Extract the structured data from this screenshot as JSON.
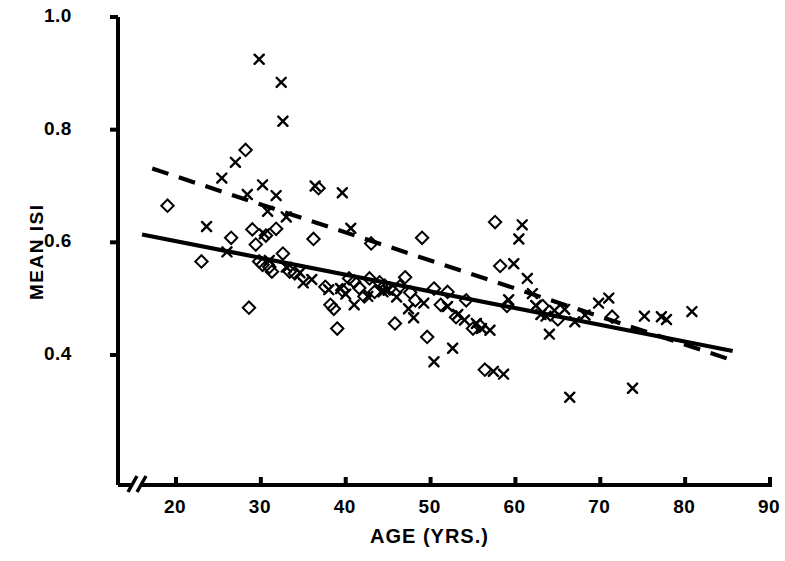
{
  "chart_data": {
    "type": "scatter",
    "title": "",
    "xlabel": "AGE  (YRS.)",
    "ylabel": "MEAN ISI",
    "xlim": [
      15,
      90
    ],
    "ylim": [
      0.29,
      1.0
    ],
    "grid": false,
    "legend_position": "none",
    "axis_break": {
      "axis": "x",
      "at": 16,
      "symbol": "//"
    },
    "xticks": [
      20,
      30,
      40,
      50,
      60,
      70,
      80,
      90
    ],
    "xtick_labels": [
      "20",
      "30",
      "40",
      "50",
      "60",
      "70",
      "80",
      "90"
    ],
    "yticks": [
      0.4,
      0.6,
      0.8,
      1.0
    ],
    "ytick_labels": [
      "0.4",
      "0.6",
      "0.8",
      "1.0"
    ],
    "series": [
      {
        "name": "diamond-group",
        "marker": "diamond",
        "color": "#000000",
        "points": [
          [
            19.0,
            0.665
          ],
          [
            23.0,
            0.566
          ],
          [
            26.5,
            0.608
          ],
          [
            28.2,
            0.764
          ],
          [
            29.0,
            0.623
          ],
          [
            29.4,
            0.596
          ],
          [
            29.8,
            0.566
          ],
          [
            30.2,
            0.56
          ],
          [
            30.6,
            0.612
          ],
          [
            31.0,
            0.556
          ],
          [
            31.3,
            0.548
          ],
          [
            31.8,
            0.624
          ],
          [
            28.6,
            0.484
          ],
          [
            32.6,
            0.58
          ],
          [
            33.4,
            0.548
          ],
          [
            34.0,
            0.545
          ],
          [
            36.2,
            0.606
          ],
          [
            37.6,
            0.521
          ],
          [
            38.2,
            0.489
          ],
          [
            38.6,
            0.482
          ],
          [
            39.0,
            0.447
          ],
          [
            39.6,
            0.515
          ],
          [
            40.4,
            0.536
          ],
          [
            41.0,
            0.53
          ],
          [
            41.6,
            0.519
          ],
          [
            42.2,
            0.504
          ],
          [
            42.8,
            0.536
          ],
          [
            43.4,
            0.512
          ],
          [
            44.0,
            0.529
          ],
          [
            44.6,
            0.523
          ],
          [
            45.2,
            0.518
          ],
          [
            45.8,
            0.456
          ],
          [
            46.4,
            0.522
          ],
          [
            47.0,
            0.538
          ],
          [
            47.6,
            0.511
          ],
          [
            48.2,
            0.497
          ],
          [
            49.0,
            0.608
          ],
          [
            49.6,
            0.432
          ],
          [
            50.4,
            0.518
          ],
          [
            51.2,
            0.489
          ],
          [
            52.0,
            0.512
          ],
          [
            53.0,
            0.467
          ],
          [
            54.2,
            0.497
          ],
          [
            55.0,
            0.447
          ],
          [
            55.8,
            0.452
          ],
          [
            56.4,
            0.374
          ],
          [
            57.6,
            0.636
          ],
          [
            58.2,
            0.558
          ],
          [
            59.0,
            0.487
          ],
          [
            63.2,
            0.487
          ],
          [
            65.0,
            0.463
          ],
          [
            71.4,
            0.468
          ],
          [
            36.8,
            0.696
          ],
          [
            43.0,
            0.598
          ]
        ]
      },
      {
        "name": "cross-group",
        "marker": "x",
        "color": "#000000",
        "points": [
          [
            29.8,
            0.925
          ],
          [
            32.4,
            0.884
          ],
          [
            32.6,
            0.815
          ],
          [
            27.0,
            0.742
          ],
          [
            30.2,
            0.702
          ],
          [
            25.4,
            0.714
          ],
          [
            28.4,
            0.685
          ],
          [
            31.8,
            0.683
          ],
          [
            30.8,
            0.655
          ],
          [
            33.0,
            0.645
          ],
          [
            23.6,
            0.628
          ],
          [
            30.4,
            0.615
          ],
          [
            36.4,
            0.7
          ],
          [
            39.6,
            0.688
          ],
          [
            40.6,
            0.625
          ],
          [
            26.0,
            0.583
          ],
          [
            31.0,
            0.568
          ],
          [
            34.6,
            0.546
          ],
          [
            33.0,
            0.556
          ],
          [
            35.0,
            0.528
          ],
          [
            36.0,
            0.534
          ],
          [
            38.0,
            0.516
          ],
          [
            39.4,
            0.518
          ],
          [
            40.0,
            0.508
          ],
          [
            41.0,
            0.489
          ],
          [
            42.6,
            0.504
          ],
          [
            44.4,
            0.512
          ],
          [
            46.0,
            0.503
          ],
          [
            47.4,
            0.482
          ],
          [
            48.0,
            0.466
          ],
          [
            49.2,
            0.492
          ],
          [
            50.4,
            0.388
          ],
          [
            52.0,
            0.486
          ],
          [
            53.2,
            0.472
          ],
          [
            54.0,
            0.462
          ],
          [
            55.4,
            0.456
          ],
          [
            56.0,
            0.447
          ],
          [
            57.0,
            0.444
          ],
          [
            57.4,
            0.371
          ],
          [
            58.6,
            0.366
          ],
          [
            59.2,
            0.498
          ],
          [
            59.8,
            0.562
          ],
          [
            60.4,
            0.606
          ],
          [
            60.8,
            0.631
          ],
          [
            61.4,
            0.536
          ],
          [
            62.0,
            0.509
          ],
          [
            62.4,
            0.488
          ],
          [
            63.0,
            0.472
          ],
          [
            63.6,
            0.469
          ],
          [
            64.0,
            0.437
          ],
          [
            64.6,
            0.479
          ],
          [
            65.8,
            0.481
          ],
          [
            66.4,
            0.325
          ],
          [
            67.0,
            0.459
          ],
          [
            68.2,
            0.471
          ],
          [
            69.8,
            0.492
          ],
          [
            71.0,
            0.501
          ],
          [
            73.8,
            0.341
          ],
          [
            75.2,
            0.469
          ],
          [
            77.2,
            0.468
          ],
          [
            77.8,
            0.463
          ],
          [
            80.8,
            0.477
          ],
          [
            52.6,
            0.412
          ],
          [
            45.0,
            0.515
          ]
        ]
      }
    ],
    "fit_lines": [
      {
        "name": "solid-fit-line",
        "style": "solid",
        "color": "#000000",
        "x_start": 16.0,
        "y_start": 0.614,
        "x_end": 85.6,
        "y_end": 0.407
      },
      {
        "name": "dashed-fit-line",
        "style": "dashed",
        "color": "#000000",
        "x_start": 17.2,
        "y_start": 0.731,
        "x_end": 85.3,
        "y_end": 0.392
      }
    ]
  },
  "axes": {
    "y_axis_label": "MEAN ISI",
    "x_axis_label": "AGE  (YRS.)",
    "y_tick_labels": [
      "1.0",
      "0.8",
      "0.6",
      "0.4"
    ],
    "x_tick_labels": [
      "20",
      "30",
      "40",
      "50",
      "60",
      "70",
      "80",
      "90"
    ]
  }
}
